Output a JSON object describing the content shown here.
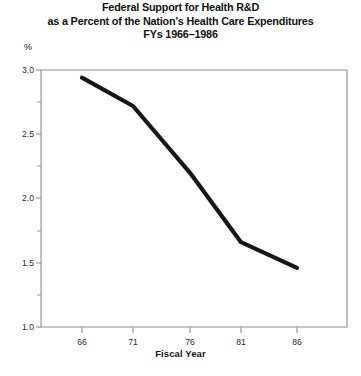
{
  "title": {
    "line1": "Federal Support for Health R&D",
    "line2": "as a Percent of the Nation's Health Care Expenditures",
    "line3": "FYs 1966–1986"
  },
  "axes": {
    "y_unit": "%",
    "x_title": "Fiscal Year",
    "y_ticks": [
      "3.0",
      "2.5",
      "2.0",
      "1.5",
      "1.0"
    ],
    "x_ticks": [
      "66",
      "71",
      "76",
      "81",
      "86"
    ]
  },
  "chart_data": {
    "type": "line",
    "xlabel": "Fiscal Year",
    "ylabel": "%",
    "x": [
      66,
      71,
      76,
      81,
      86
    ],
    "values": [
      2.94,
      2.72,
      2.2,
      1.66,
      1.46
    ],
    "categories": [
      "66",
      "71",
      "76",
      "81",
      "86"
    ],
    "xlim": [
      64,
      90
    ],
    "ylim": [
      1.0,
      3.0
    ],
    "y_major_ticks": [
      1.0,
      1.5,
      2.0,
      2.5,
      3.0
    ],
    "y_minor_ticks": [
      1.25,
      1.75,
      2.25,
      2.75
    ],
    "grid": false,
    "legend": "none",
    "line_color": "#17171a"
  }
}
